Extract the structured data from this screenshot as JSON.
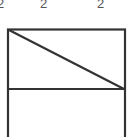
{
  "labels": [
    {
      "text": "2",
      "x": 0
    },
    {
      "text": "2",
      "x": 40
    },
    {
      "text": "2",
      "x": 97
    }
  ],
  "diagram": {
    "stroke_color": "#333333",
    "shapes": [
      "outer-rectangle",
      "horizontal-divider",
      "diagonal-line"
    ]
  }
}
